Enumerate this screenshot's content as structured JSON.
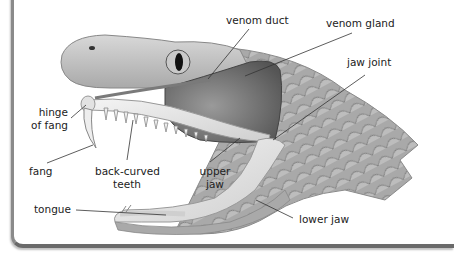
{
  "diagram": {
    "labels": [
      {
        "id": "venom-duct",
        "text": "venom duct"
      },
      {
        "id": "venom-gland",
        "text": "venom gland"
      },
      {
        "id": "jaw-joint",
        "text": "jaw joint"
      },
      {
        "id": "hinge-of-fang",
        "line1": "hinge",
        "line2": "of fang"
      },
      {
        "id": "fang",
        "text": "fang"
      },
      {
        "id": "back-curved-teeth",
        "line1": "back-curved",
        "line2": "teeth"
      },
      {
        "id": "upper-jaw",
        "line1": "upper",
        "line2": "jaw"
      },
      {
        "id": "tongue",
        "text": "tongue"
      },
      {
        "id": "lower-jaw",
        "text": "lower jaw"
      }
    ],
    "colors": {
      "text": "#222222",
      "leader_line": "#333333",
      "scales": "#a8a8a8",
      "gland": "#6e6e6e",
      "bone": "#e6e6e6",
      "frame": "#7a7a7a"
    }
  }
}
